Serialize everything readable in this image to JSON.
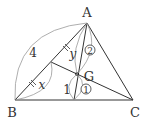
{
  "diagram": {
    "type": "triangle-centroid",
    "vertices": {
      "A": {
        "label": "A",
        "x": 87,
        "y": 23
      },
      "B": {
        "label": "B",
        "x": 15,
        "y": 100
      },
      "C": {
        "label": "C",
        "x": 133,
        "y": 100
      }
    },
    "centroid": {
      "label": "G",
      "x": 77,
      "y": 74
    },
    "midpoint_AB": {
      "x": 51,
      "y": 62
    },
    "midpoint_BC": {
      "x": 74,
      "y": 100
    },
    "labels": {
      "side_AB": "4",
      "x": "x",
      "y": "y",
      "one": "1",
      "ratio_top": "2",
      "ratio_bottom": "1"
    },
    "colors": {
      "line": "#333333",
      "arc": "#888888"
    }
  }
}
